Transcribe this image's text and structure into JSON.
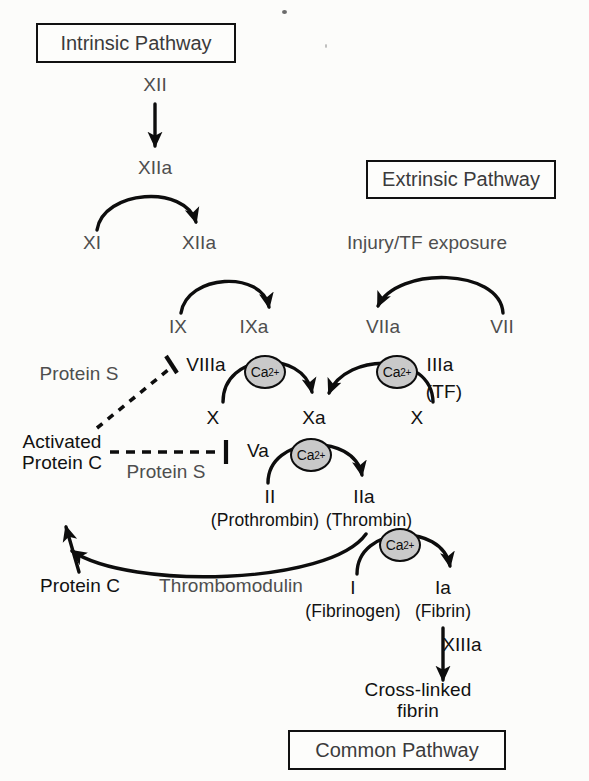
{
  "diagram": {
    "ca_label": "Ca",
    "ca_charge": "2+"
  },
  "boxes": [
    {
      "name": "intrinsic-pathway-box",
      "label": "Intrinsic Pathway",
      "x": 36,
      "y": 23,
      "w": 200,
      "h": 40
    },
    {
      "name": "extrinsic-pathway-box",
      "label": "Extrinsic Pathway",
      "x": 366,
      "y": 160,
      "w": 190,
      "h": 39
    },
    {
      "name": "common-pathway-box",
      "label": "Common Pathway",
      "x": 288,
      "y": 730,
      "w": 218,
      "h": 40
    }
  ],
  "labels": [
    {
      "name": "factor-xii",
      "text": "XII",
      "x": 155,
      "y": 85,
      "gray": true
    },
    {
      "name": "factor-xiia-activated",
      "text": "XIIa",
      "x": 155,
      "y": 168,
      "gray": true
    },
    {
      "name": "factor-xi",
      "text": "XI",
      "x": 92,
      "y": 243,
      "gray": true
    },
    {
      "name": "factor-xiia-second",
      "text": "XIIa",
      "x": 199,
      "y": 243,
      "gray": true
    },
    {
      "name": "factor-ix",
      "text": "IX",
      "x": 178,
      "y": 327,
      "gray": true
    },
    {
      "name": "factor-ixa",
      "text": "IXa",
      "x": 254,
      "y": 327,
      "gray": true
    },
    {
      "name": "injury-tf-exposure",
      "text": "Injury/TF exposure",
      "x": 427,
      "y": 243,
      "gray": true
    },
    {
      "name": "factor-viia",
      "text": "VIIa",
      "x": 383,
      "y": 327,
      "gray": true
    },
    {
      "name": "factor-vii",
      "text": "VII",
      "x": 502,
      "y": 327,
      "gray": true
    },
    {
      "name": "factor-viiia",
      "text": "VIIIa",
      "x": 206,
      "y": 365,
      "gray": false
    },
    {
      "name": "factor-iiia",
      "text": "IIIa",
      "x": 440,
      "y": 365,
      "gray": false
    },
    {
      "name": "tissue-factor-note",
      "text": "(TF)",
      "x": 444,
      "y": 392,
      "gray": false
    },
    {
      "name": "protein-s-upper",
      "text": "Protein S",
      "x": 79,
      "y": 374,
      "gray": true
    },
    {
      "name": "factor-x-left",
      "text": "X",
      "x": 213,
      "y": 418,
      "gray": false
    },
    {
      "name": "factor-xa",
      "text": "Xa",
      "x": 314,
      "y": 418,
      "gray": false
    },
    {
      "name": "factor-x-right",
      "text": "X",
      "x": 417,
      "y": 418,
      "gray": false
    },
    {
      "name": "activated-protein-c",
      "text": "Activated\nProtein C",
      "x": 62,
      "y": 452,
      "gray": false
    },
    {
      "name": "protein-s-lower",
      "text": "Protein S",
      "x": 166,
      "y": 472,
      "gray": true
    },
    {
      "name": "factor-va",
      "text": "Va",
      "x": 258,
      "y": 451,
      "gray": false
    },
    {
      "name": "factor-ii",
      "text": "II",
      "x": 270,
      "y": 497,
      "gray": false
    },
    {
      "name": "prothrombin",
      "text": "(Prothrombin)",
      "x": 265,
      "y": 521,
      "gray": false
    },
    {
      "name": "factor-iia",
      "text": "IIa",
      "x": 364,
      "y": 497,
      "gray": false
    },
    {
      "name": "thrombin",
      "text": "(Thrombin)",
      "x": 369,
      "y": 521,
      "gray": false
    },
    {
      "name": "protein-c",
      "text": "Protein C",
      "x": 80,
      "y": 586,
      "gray": false
    },
    {
      "name": "thrombomodulin",
      "text": "Thrombomodulin",
      "x": 231,
      "y": 586,
      "gray": true
    },
    {
      "name": "factor-i",
      "text": "I",
      "x": 353,
      "y": 588,
      "gray": false
    },
    {
      "name": "fibrinogen",
      "text": "(Fibrinogen)",
      "x": 353,
      "y": 612,
      "gray": false
    },
    {
      "name": "factor-ia",
      "text": "Ia",
      "x": 443,
      "y": 588,
      "gray": false
    },
    {
      "name": "fibrin",
      "text": "(Fibrin)",
      "x": 443,
      "y": 612,
      "gray": false
    },
    {
      "name": "factor-xiiia",
      "text": "XIIIa",
      "x": 462,
      "y": 645,
      "gray": false
    },
    {
      "name": "cross-linked-fibrin",
      "text": "Cross-linked\nfibrin",
      "x": 418,
      "y": 700,
      "gray": false
    }
  ],
  "calcium_ions": [
    {
      "name": "ca-ion-intrinsic-tenase",
      "x": 265,
      "y": 372,
      "d": 42
    },
    {
      "name": "ca-ion-extrinsic-tenase",
      "x": 397,
      "y": 372,
      "d": 42
    },
    {
      "name": "ca-ion-prothrombinase",
      "x": 311,
      "y": 455,
      "d": 42
    },
    {
      "name": "ca-ion-fibrin-formation",
      "x": 400,
      "y": 545,
      "d": 42
    }
  ],
  "edges": [
    {
      "name": "arrow-xii-to-xiia",
      "kind": "straight-arrow",
      "from": "XII",
      "to": "XIIa"
    },
    {
      "name": "arc-xi-to-xiia",
      "kind": "curved-arrow",
      "from": "XI",
      "to": "XIIa"
    },
    {
      "name": "arc-ix-to-ixa",
      "kind": "curved-arrow",
      "from": "IX",
      "to": "IXa"
    },
    {
      "name": "arc-vii-to-viia",
      "kind": "curved-arrow",
      "from": "VII",
      "to": "VIIa"
    },
    {
      "name": "arc-x-to-xa-intrinsic",
      "kind": "curved-arrow",
      "from": "X",
      "to": "Xa"
    },
    {
      "name": "arc-x-to-xa-extrinsic",
      "kind": "curved-arrow",
      "from": "X",
      "to": "Xa"
    },
    {
      "name": "arc-ii-to-iia",
      "kind": "curved-arrow",
      "from": "II",
      "to": "IIa"
    },
    {
      "name": "arc-i-to-ia",
      "kind": "curved-arrow",
      "from": "I",
      "to": "Ia"
    },
    {
      "name": "arrow-ia-to-crosslinked",
      "kind": "straight-arrow",
      "from": "Ia",
      "to": "Cross-linked fibrin"
    },
    {
      "name": "arc-thrombomodulin-feedback",
      "kind": "curved-arrow",
      "from": "IIa",
      "to": "Activated Protein C"
    },
    {
      "name": "arrow-protein-c-activation",
      "kind": "straight-arrow",
      "from": "Protein C",
      "to": "Activated Protein C"
    },
    {
      "name": "inhibition-apc-to-viiia",
      "kind": "dashed-inhibit",
      "from": "Activated Protein C",
      "to": "VIIIa"
    },
    {
      "name": "inhibition-apc-to-va",
      "kind": "dashed-inhibit",
      "from": "Activated Protein C",
      "to": "Va"
    }
  ],
  "colors": {
    "background": "#fcfcfa",
    "ink": "#111111",
    "gray_text": "#4e4e4e",
    "calcium_fill": "#c9c9c9"
  }
}
